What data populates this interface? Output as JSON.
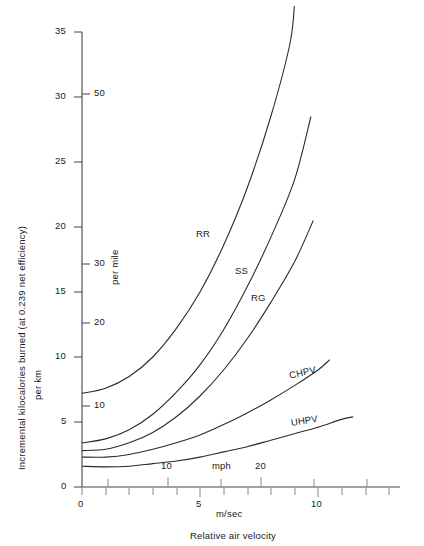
{
  "figure": {
    "xlabel_units": "m/sec",
    "xlabel_units_secondary": "mph",
    "xlabel_title": "Relative air velocity",
    "ylabel_line1": "Incremental kilocalories burned (at 0.239 net efficiency)",
    "ylabel_line2": "per km",
    "ylabel_secondary": "per mile"
  },
  "chart_data": {
    "type": "line",
    "title": "",
    "xlabel": "Relative air velocity (m/sec)",
    "ylabel": "Incremental kilocalories burned (at 0.239 net efficiency) per km",
    "xlim": [
      0,
      14.4
    ],
    "ylim": [
      0,
      35
    ],
    "grid": false,
    "legend": "inline-curve-labels",
    "x_axis": {
      "units": "m/sec",
      "ticks_major": [
        0,
        5,
        10
      ],
      "tick_labels": [
        "0",
        "5",
        "10"
      ],
      "tick_minor_step": 1
    },
    "x_axis_secondary": {
      "units": "mph",
      "ticks_major": [
        10,
        20
      ],
      "tick_labels": [
        "10",
        "20"
      ],
      "tick_minor_step": 2.5,
      "conversion_mph_per_mps": 2.2369
    },
    "y_axis": {
      "units": "per km",
      "ticks_major": [
        0,
        5,
        10,
        15,
        20,
        25,
        30,
        35
      ],
      "tick_labels": [
        "0",
        "5",
        "10",
        "15",
        "20",
        "25",
        "30",
        "35"
      ]
    },
    "y_axis_secondary": {
      "units": "per mile",
      "ticks_major": [
        10,
        20,
        30,
        50
      ],
      "tick_labels": [
        "10",
        "20",
        "30",
        "50"
      ],
      "conversion_km_per_mile": 1.609
    },
    "series": [
      {
        "name": "RR",
        "label": "RR",
        "points": [
          [
            0,
            7.2
          ],
          [
            1,
            7.6
          ],
          [
            2,
            8.5
          ],
          [
            3,
            10.0
          ],
          [
            4,
            12.2
          ],
          [
            5,
            15.0
          ],
          [
            6,
            18.6
          ],
          [
            7,
            23.0
          ],
          [
            8,
            28.5
          ],
          [
            8.8,
            34.0
          ],
          [
            9.0,
            37.0
          ]
        ]
      },
      {
        "name": "SS",
        "label": "SS",
        "points": [
          [
            0,
            3.4
          ],
          [
            1,
            3.7
          ],
          [
            2,
            4.4
          ],
          [
            3,
            5.6
          ],
          [
            4,
            7.3
          ],
          [
            5,
            9.4
          ],
          [
            6,
            12.1
          ],
          [
            7,
            15.4
          ],
          [
            8,
            19.2
          ],
          [
            9,
            23.6
          ],
          [
            9.7,
            28.5
          ]
        ]
      },
      {
        "name": "RG",
        "label": "RG",
        "points": [
          [
            0,
            2.8
          ],
          [
            1,
            2.9
          ],
          [
            2,
            3.4
          ],
          [
            3,
            4.2
          ],
          [
            4,
            5.4
          ],
          [
            5,
            7.0
          ],
          [
            6,
            9.0
          ],
          [
            7,
            11.4
          ],
          [
            8,
            14.2
          ],
          [
            9,
            17.3
          ],
          [
            9.8,
            20.5
          ]
        ]
      },
      {
        "name": "CHPV",
        "label": "CHPV",
        "points": [
          [
            0,
            2.3
          ],
          [
            1,
            2.3
          ],
          [
            2,
            2.5
          ],
          [
            3,
            2.9
          ],
          [
            4,
            3.4
          ],
          [
            5,
            4.0
          ],
          [
            6,
            4.8
          ],
          [
            7,
            5.7
          ],
          [
            8,
            6.7
          ],
          [
            9,
            7.8
          ],
          [
            10,
            9.0
          ],
          [
            10.5,
            9.8
          ]
        ]
      },
      {
        "name": "UHPV",
        "label": "UHPV",
        "points": [
          [
            0,
            1.6
          ],
          [
            1,
            1.55
          ],
          [
            2,
            1.6
          ],
          [
            3,
            1.8
          ],
          [
            4,
            2.0
          ],
          [
            5,
            2.3
          ],
          [
            6,
            2.7
          ],
          [
            7,
            3.1
          ],
          [
            8,
            3.6
          ],
          [
            9,
            4.1
          ],
          [
            10,
            4.6
          ],
          [
            11,
            5.2
          ],
          [
            11.5,
            5.4
          ]
        ]
      }
    ]
  },
  "curve_labels": [
    {
      "text": "RR"
    },
    {
      "text": "SS"
    },
    {
      "text": "RG"
    },
    {
      "text": "CHPV"
    },
    {
      "text": "UHPV"
    }
  ],
  "y_ticks_primary": [
    {
      "label": "35"
    },
    {
      "label": "30"
    },
    {
      "label": "25"
    },
    {
      "label": "20"
    },
    {
      "label": "15"
    },
    {
      "label": "10"
    },
    {
      "label": "5"
    },
    {
      "label": "0"
    }
  ],
  "y_ticks_secondary": [
    {
      "label": "50"
    },
    {
      "label": "30"
    },
    {
      "label": "20"
    },
    {
      "label": "10"
    }
  ],
  "x_ticks_primary": [
    {
      "label": "0"
    },
    {
      "label": "5"
    },
    {
      "label": "10"
    }
  ],
  "x_ticks_secondary": [
    {
      "label": "10"
    },
    {
      "label": "20"
    }
  ]
}
